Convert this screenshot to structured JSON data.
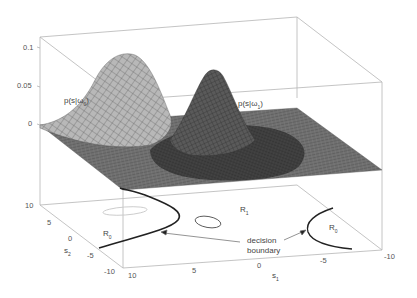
{
  "figure": {
    "type": "3d-surface-with-contour-projection",
    "z_axis": {
      "ticks": [
        "0.1",
        "0.05",
        "0"
      ]
    },
    "s2_axis": {
      "label": "s",
      "label_sub": "2",
      "ticks": [
        "10",
        "5",
        "0",
        "-5",
        "-10"
      ]
    },
    "s1_axis": {
      "label": "s",
      "label_sub": "1",
      "ticks": [
        "10",
        "5",
        "0",
        "-5",
        "-10"
      ]
    },
    "surface_labels": {
      "omega0": {
        "text": "p(s|ω",
        "sub": "0",
        "close": ")"
      },
      "omega1": {
        "text": "p(s|ω",
        "sub": "1",
        "close": ")"
      }
    },
    "region_labels": {
      "r0_left": {
        "text": "R",
        "sub": "0"
      },
      "r1": {
        "text": "R",
        "sub": "1"
      },
      "r0_right": {
        "text": "R",
        "sub": "0"
      }
    },
    "annotation": {
      "line1": "decision",
      "line2": "boundary"
    },
    "colors": {
      "box": "#b0b0b0",
      "mesh_light": "#a8a8a8",
      "mesh_dark": "#3a3a3a",
      "plane": "#6a6a6a",
      "boundary": "#222222"
    }
  }
}
